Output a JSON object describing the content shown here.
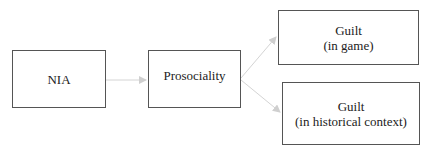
{
  "diagram": {
    "nodes": [
      {
        "id": "nia",
        "lines": [
          "NIA"
        ]
      },
      {
        "id": "prosociality",
        "lines": [
          "Prosociality"
        ]
      },
      {
        "id": "guilt_game",
        "lines": [
          "Guilt",
          "(in game)"
        ]
      },
      {
        "id": "guilt_historical",
        "lines": [
          "Guilt",
          "(in historical context)"
        ]
      }
    ],
    "edges": [
      {
        "from": "nia",
        "to": "prosociality"
      },
      {
        "from": "prosociality",
        "to": "guilt_game"
      },
      {
        "from": "prosociality",
        "to": "guilt_historical"
      }
    ],
    "colors": {
      "box_border": "#555555",
      "arrow": "#cccccc",
      "text": "#222222"
    }
  }
}
